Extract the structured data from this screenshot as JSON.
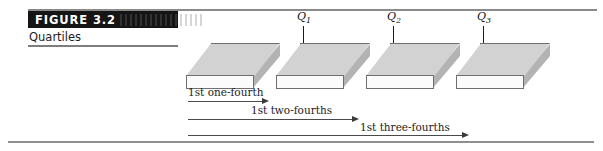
{
  "figure": {
    "number_label": "FIGURE 3.2",
    "banner_artifact": "",
    "caption": "Quartiles"
  },
  "quartiles": [
    {
      "name": "Q1",
      "base": "Q",
      "subscript": "1",
      "icon": "down-arrow-icon",
      "x": 291,
      "y": 10
    },
    {
      "name": "Q2",
      "base": "Q",
      "subscript": "2",
      "icon": "down-arrow-icon",
      "x": 381,
      "y": 10
    },
    {
      "name": "Q3",
      "base": "Q",
      "subscript": "3",
      "icon": "down-arrow-icon",
      "x": 471,
      "y": 10
    }
  ],
  "blocks": [
    {
      "name": "quarter-block-1",
      "x": 186,
      "y": 43
    },
    {
      "name": "quarter-block-2",
      "x": 276,
      "y": 43
    },
    {
      "name": "quarter-block-3",
      "x": 366,
      "y": 43
    },
    {
      "name": "quarter-block-4",
      "x": 456,
      "y": 43
    }
  ],
  "spans": [
    {
      "label": "1st one-fourth",
      "label_x": 188,
      "label_y": 86,
      "line_x": 188,
      "line_y": 101,
      "line_width": 74
    },
    {
      "label": "1st two-fourths",
      "label_x": 251,
      "label_y": 104,
      "line_x": 188,
      "line_y": 119,
      "line_width": 164
    },
    {
      "label": "1st three-fourths",
      "label_x": 360,
      "label_y": 121,
      "line_x": 188,
      "line_y": 135,
      "line_width": 274
    }
  ],
  "colors": {
    "banner_background": "#151515",
    "banner_text": "#ffffff",
    "rule": "#8a8a8a",
    "slab_top": "#d2d2d2",
    "slab_front": "#fbfbfb",
    "slab_side": "#b3b3b3",
    "slab_outline": "#6f6f6f",
    "arrow": "#3a3a3a",
    "text": "#1c1c1c"
  }
}
